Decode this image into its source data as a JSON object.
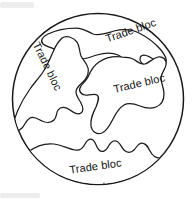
{
  "diagram": {
    "type": "globe-trade-blocs",
    "background_color": "#ffffff",
    "stroke_color": "#1a1a1a",
    "fill_color": "#ffffff",
    "globe": {
      "name": "globe-circle",
      "center_x": 98,
      "center_y": 99,
      "radius": 85.5
    },
    "labels": [
      {
        "id": "top-right",
        "text": "Trade bloc",
        "x": 132,
        "y": 34,
        "rotation": -19
      },
      {
        "id": "left",
        "text": "Trade bloc",
        "x": 44,
        "y": 68,
        "rotation": 64
      },
      {
        "id": "center",
        "text": "Trade bloc",
        "x": 140,
        "y": 87,
        "rotation": -13
      },
      {
        "id": "bottom",
        "text": "Trade bloc",
        "x": 96,
        "y": 170,
        "rotation": -8
      }
    ]
  }
}
